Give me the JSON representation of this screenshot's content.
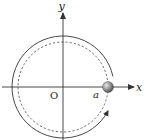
{
  "diagram": {
    "type": "circular-motion",
    "labels": {
      "x_axis": "x",
      "y_axis": "y",
      "origin": "O",
      "radius": "a"
    },
    "elements": {
      "dashed_circle": "orbit path",
      "solid_arc": "direction of motion (counterclockwise)",
      "ball": "particle at (a, 0)"
    },
    "colors": {
      "line": "#333333",
      "ball_light": "#d8d8d8",
      "ball_dark": "#555555"
    }
  }
}
